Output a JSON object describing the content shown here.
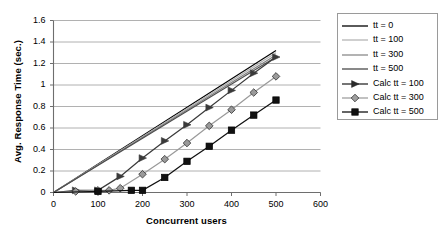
{
  "chart_data": {
    "type": "line",
    "title": "",
    "xlabel": "Concurrent users",
    "ylabel": "Avg. Response Time (sec.)",
    "xlim": [
      0,
      600
    ],
    "ylim": [
      0,
      1.6
    ],
    "xticks": [
      0,
      100,
      200,
      300,
      400,
      500,
      600
    ],
    "yticks": [
      0,
      0.2,
      0.4,
      0.6,
      0.8,
      1,
      1.2,
      1.4,
      1.6
    ],
    "xtick_labels": [
      "0",
      "100",
      "200",
      "300",
      "400",
      "500",
      "600"
    ],
    "ytick_labels": [
      "0",
      "0.2",
      "0.4",
      "0.6",
      "0.8",
      "1",
      "1.2",
      "1.4",
      "1.6"
    ],
    "grid": "horizontal",
    "legend_position": "right-outside",
    "series": [
      {
        "name": "tt = 0",
        "marker": "none",
        "color": "#000000",
        "x": [
          0,
          500
        ],
        "y": [
          0,
          1.32
        ]
      },
      {
        "name": "tt = 100",
        "marker": "none",
        "color": "#b0b0b0",
        "x": [
          0,
          500
        ],
        "y": [
          0,
          1.3
        ]
      },
      {
        "name": "tt = 300",
        "marker": "none",
        "color": "#808080",
        "x": [
          0,
          500
        ],
        "y": [
          0,
          1.28
        ]
      },
      {
        "name": "tt = 500",
        "marker": "none",
        "color": "#4d4d4d",
        "x": [
          0,
          500
        ],
        "y": [
          0,
          1.26
        ]
      },
      {
        "name": "Calc tt = 100",
        "marker": "triangle",
        "color": "#3a3a3a",
        "x": [
          0,
          50,
          100,
          150,
          200,
          250,
          300,
          350,
          400,
          450,
          500
        ],
        "y": [
          0,
          0.02,
          0.02,
          0.15,
          0.32,
          0.48,
          0.63,
          0.79,
          0.95,
          1.11,
          1.26
        ]
      },
      {
        "name": "Calc tt = 300",
        "marker": "diamond",
        "color": "#9a9a9a",
        "x": [
          0,
          50,
          100,
          125,
          150,
          200,
          250,
          300,
          350,
          400,
          450,
          500
        ],
        "y": [
          0,
          0.01,
          0.02,
          0.02,
          0.04,
          0.17,
          0.31,
          0.46,
          0.62,
          0.77,
          0.93,
          1.08
        ]
      },
      {
        "name": "Calc tt = 500",
        "marker": "square",
        "color": "#111111",
        "x": [
          0,
          100,
          175,
          200,
          250,
          300,
          350,
          400,
          450,
          500
        ],
        "y": [
          0,
          0.01,
          0.02,
          0.02,
          0.14,
          0.29,
          0.43,
          0.58,
          0.72,
          0.86
        ]
      }
    ]
  },
  "legend": {
    "items": [
      {
        "label": "tt = 0",
        "marker": "none",
        "color": "#000000"
      },
      {
        "label": "tt = 100",
        "marker": "none",
        "color": "#b5b5b5"
      },
      {
        "label": "tt = 300",
        "marker": "none",
        "color": "#8a8a8a"
      },
      {
        "label": "tt = 500",
        "marker": "none",
        "color": "#4a4a4a"
      },
      {
        "label": "Calc tt = 100",
        "marker": "triangle",
        "color": "#2b2b2b"
      },
      {
        "label": "Calc tt = 300",
        "marker": "diamond",
        "color": "#a0a0a0"
      },
      {
        "label": "Calc tt = 500",
        "marker": "square",
        "color": "#111111"
      }
    ]
  }
}
